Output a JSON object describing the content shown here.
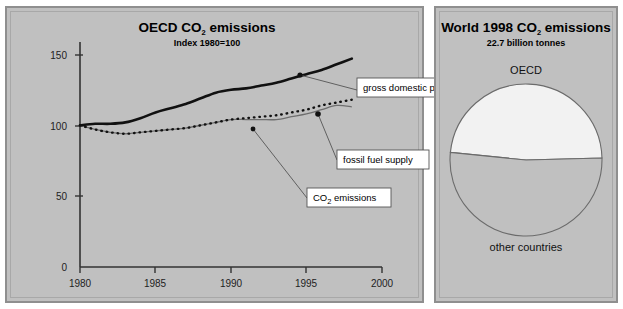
{
  "chart_data": [
    {
      "type": "line",
      "title": "OECD CO2 emissions",
      "title_parts": {
        "pre": "OECD CO",
        "sub": "2",
        "post": " emissions"
      },
      "subtitle": "Index 1980=100",
      "xlabel": "",
      "ylabel": "",
      "xlim": [
        1980,
        2000
      ],
      "ylim": [
        0,
        170
      ],
      "xticks": [
        "1980",
        "1985",
        "1990",
        "1995",
        "2000"
      ],
      "xtick_values": [
        1980,
        1985,
        1990,
        1995,
        2000
      ],
      "yticks": [
        "0",
        "50",
        "100",
        "150"
      ],
      "ytick_values": [
        0,
        50,
        100,
        150
      ],
      "grid": false,
      "legend": "callout-labels",
      "x": [
        1980,
        1981,
        1982,
        1983,
        1984,
        1985,
        1986,
        1987,
        1988,
        1989,
        1990,
        1991,
        1992,
        1993,
        1994,
        1995,
        1996,
        1997,
        1998
      ],
      "series": [
        {
          "name": "gross domestic product",
          "style": "thick-solid-black",
          "color": "#111111",
          "values": [
            100,
            101,
            101,
            102,
            105,
            109,
            112,
            115,
            119,
            123,
            125,
            126,
            128,
            130,
            133,
            136,
            139,
            143,
            147
          ]
        },
        {
          "name": "fossil fuel supply",
          "style": "dotted-black",
          "color": "#111111",
          "values": [
            100,
            97,
            95,
            94,
            95,
            96,
            97,
            98,
            100,
            102,
            104,
            105,
            106,
            107,
            109,
            111,
            114,
            116,
            118
          ]
        },
        {
          "name": "CO2 emissions",
          "style": "thin-solid-gray",
          "color": "#6e6e6e",
          "values": [
            100,
            97,
            95,
            94,
            95,
            96,
            97,
            98,
            100,
            102,
            104,
            104,
            104,
            104,
            106,
            108,
            111,
            114,
            113
          ]
        }
      ],
      "annotations": [
        {
          "label": "gross domestic product",
          "anchor_x": 1994.4,
          "anchor_y": 134
        },
        {
          "label": "fossil fuel supply",
          "anchor_x": 1995.6,
          "anchor_y": 114
        },
        {
          "label": "CO2 emissions",
          "anchor_x": 1991.3,
          "anchor_y": 104
        }
      ]
    },
    {
      "type": "pie",
      "title": "World 1998 CO2 emissions",
      "title_parts": {
        "pre": "World 1998 CO",
        "sub": "2",
        "post": " emissions"
      },
      "subtitle": "22.7 billion tonnes",
      "labels": [
        "OECD",
        "other countries"
      ],
      "values": [
        48,
        52
      ],
      "colors": [
        "#f2f2f2",
        "#c0c0c0"
      ],
      "legend": "outside-labels",
      "total_label": "22.7 billion tonnes"
    }
  ],
  "line_chart": {
    "title_pre": "OECD CO",
    "title_sub": "2",
    "title_post": " emissions",
    "subtitle": "Index 1980=100",
    "xtick_0": "1980",
    "xtick_1": "1985",
    "xtick_2": "1990",
    "xtick_3": "1995",
    "xtick_4": "2000",
    "ytick_0": "0",
    "ytick_1": "50",
    "ytick_2": "100",
    "ytick_3": "150",
    "callout_gdp": "gross domestic product",
    "callout_fossil": "fossil fuel supply",
    "callout_co2_pre": "CO",
    "callout_co2_sub": "2",
    "callout_co2_post": " emissions"
  },
  "pie_chart": {
    "title_pre": "World 1998 CO",
    "title_sub": "2",
    "title_post": " emissions",
    "subtitle": "22.7 billion tonnes",
    "label_oecd": "OECD",
    "label_other": "other countries"
  },
  "colors": {
    "panel_bg": "#c0c0c0",
    "panel_border": "#8f8f8f",
    "gdp": "#111111",
    "fossil": "#111111",
    "co2": "#6e6e6e",
    "pie_oecd": "#f2f2f2",
    "pie_other": "#c0c0c0",
    "callout_box": "#ffffff"
  }
}
